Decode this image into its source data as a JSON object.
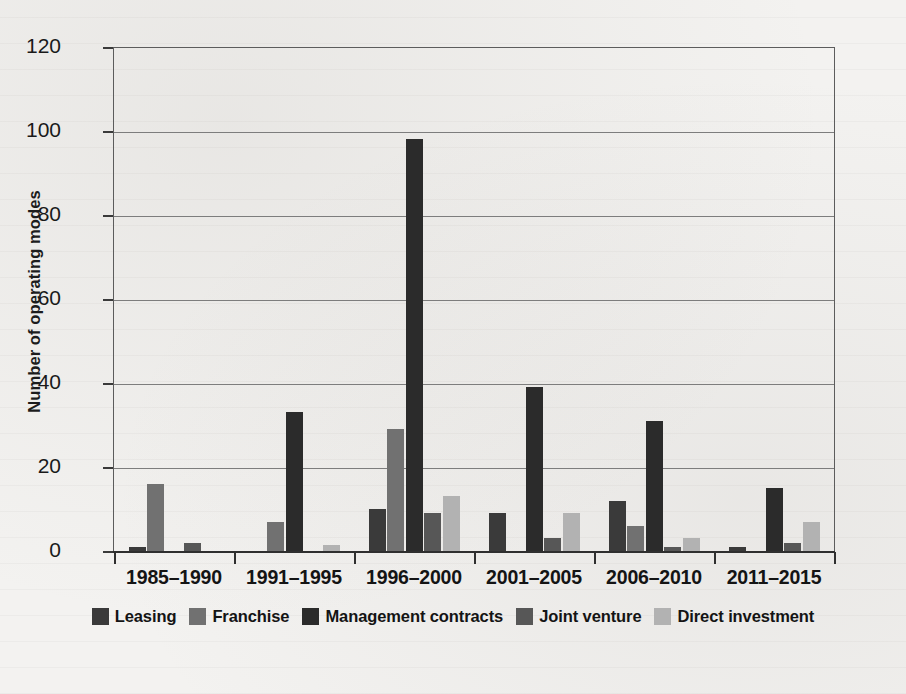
{
  "chart_data": {
    "type": "bar",
    "title": "",
    "xlabel": "",
    "ylabel": "Number of operating modes",
    "ylim": [
      0,
      120
    ],
    "ytick_values": [
      120,
      100,
      80,
      60,
      40,
      20,
      0
    ],
    "ytick_labels": [
      "120",
      "100",
      "80",
      "60",
      "40",
      "20",
      "0"
    ],
    "grid": true,
    "grid_axis": "y",
    "legend_position": "bottom-center",
    "categories": [
      "1985–1990",
      "1991–1995",
      "1996–2000",
      "2001–2005",
      "2006–2010",
      "2011–2015"
    ],
    "series": [
      {
        "name": "Leasing",
        "color": "#3a3a3a",
        "values": [
          1,
          0,
          10,
          9,
          12,
          1
        ]
      },
      {
        "name": "Franchise",
        "color": "#717171",
        "values": [
          16,
          7,
          29,
          0,
          6,
          0
        ]
      },
      {
        "name": "Management contracts",
        "color": "#2b2b2b",
        "values": [
          0,
          33,
          98,
          39,
          31,
          15
        ]
      },
      {
        "name": "Joint venture",
        "color": "#575757",
        "values": [
          2,
          0,
          9,
          3,
          1,
          2
        ]
      },
      {
        "name": "Direct investment",
        "color": "#b2b2b2",
        "values": [
          0,
          1.5,
          13,
          9,
          3,
          7
        ]
      }
    ]
  },
  "axis": {
    "y_title": "Number of operating modes"
  }
}
